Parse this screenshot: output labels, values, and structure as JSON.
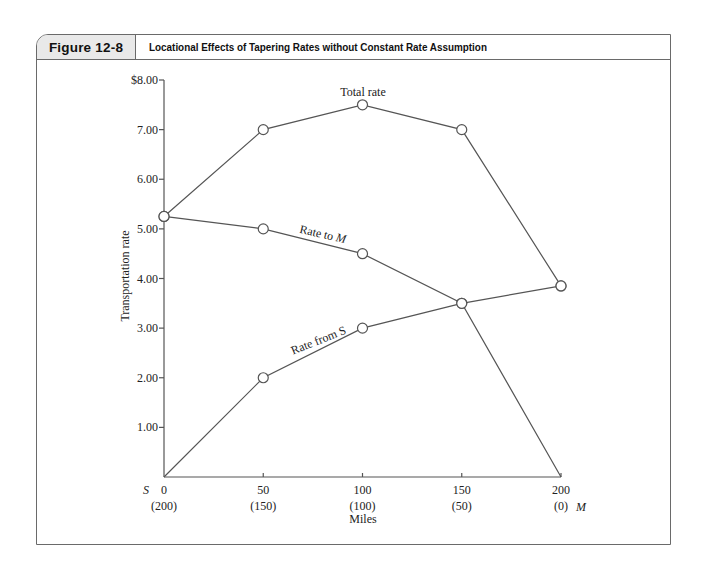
{
  "figure": {
    "number": "Figure 12-8",
    "title": "Locational Effects of Tapering Rates without Constant Rate Assumption"
  },
  "chart_data": {
    "type": "line",
    "title": "Locational Effects of Tapering Rates without Constant Rate Assumption",
    "xlabel": "Miles",
    "ylabel": "Transportation rate",
    "x": [
      0,
      50,
      100,
      150,
      200
    ],
    "x_tick_labels": [
      "0",
      "50",
      "100",
      "150",
      "200"
    ],
    "x_secondary_tick_labels": [
      "(200)",
      "(150)",
      "(100)",
      "(50)",
      "(0)"
    ],
    "x_endpoint_labels": {
      "left": "S",
      "right": "M"
    },
    "y_tick_labels": [
      "$8.00",
      "7.00",
      "6.00",
      "5.00",
      "4.00",
      "3.00",
      "2.00",
      "1.00"
    ],
    "ylim": [
      0,
      8
    ],
    "xlim": [
      0,
      200
    ],
    "grid": false,
    "legend": "inline labels",
    "series": [
      {
        "name": "Total rate",
        "values": [
          5.25,
          7.0,
          7.5,
          7.0,
          3.85
        ],
        "markers": [
          true,
          true,
          true,
          true,
          true
        ]
      },
      {
        "name": "Rate to M",
        "values": [
          5.25,
          5.0,
          4.5,
          3.5,
          0.0
        ],
        "markers": [
          true,
          true,
          true,
          true,
          false
        ]
      },
      {
        "name": "Rate from S",
        "values": [
          0.0,
          2.0,
          3.0,
          3.5,
          3.85
        ],
        "markers": [
          false,
          true,
          true,
          true,
          true
        ]
      }
    ]
  },
  "labels": {
    "total_rate": "Total rate",
    "rate_to_m_prefix": "Rate to ",
    "rate_to_m_italic": "M",
    "rate_from_s": "Rate from S",
    "y_axis": "Transportation rate",
    "x_axis": "Miles",
    "s_marker": "S",
    "m_marker": "M"
  }
}
